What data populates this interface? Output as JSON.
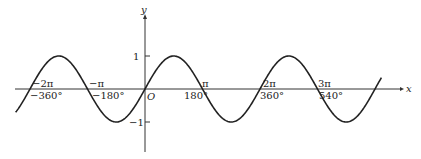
{
  "chart_data": {
    "type": "line",
    "title": "",
    "function": "y = sin x",
    "xlabel": "x",
    "ylabel": "y",
    "origin_label": "O",
    "x_range_radians": [
      -6.6,
      14.6
    ],
    "ylim": [
      -1,
      1
    ],
    "grid": false,
    "legend": null,
    "x_ticks": [
      {
        "radians": -6.2832,
        "pi_label": "−2π",
        "deg_label": "−360°"
      },
      {
        "radians": -3.1416,
        "pi_label": "−π",
        "deg_label": "−180°"
      },
      {
        "radians": 3.1416,
        "pi_label": "π",
        "deg_label": "180°"
      },
      {
        "radians": 6.2832,
        "pi_label": "2π",
        "deg_label": "360°"
      },
      {
        "radians": 9.4248,
        "pi_label": "3π",
        "deg_label": "540°"
      }
    ],
    "y_ticks": [
      {
        "value": 1,
        "label": "1"
      },
      {
        "value": -1,
        "label": "−1"
      }
    ],
    "series": [
      {
        "name": "sin x",
        "x_degrees": [
          -405,
          -360,
          -270,
          -180,
          -90,
          0,
          90,
          180,
          270,
          360,
          450,
          540,
          630,
          720,
          740
        ],
        "values": [
          -0.71,
          0,
          1,
          0,
          -1,
          0,
          1,
          0,
          -1,
          0,
          1,
          0,
          -1,
          0,
          0.34
        ]
      }
    ]
  }
}
